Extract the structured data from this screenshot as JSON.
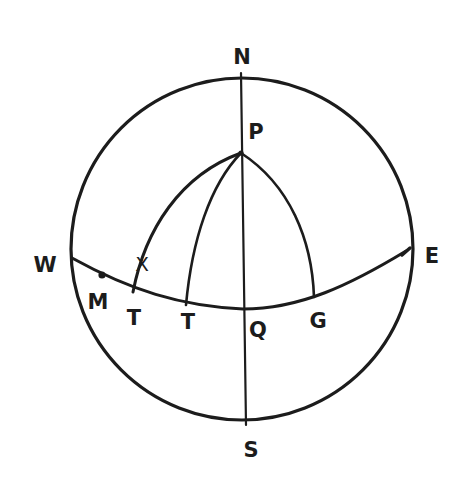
{
  "diagram": {
    "type": "celestial-sphere",
    "stroke_color": "#1c1c1c",
    "background": "#ffffff",
    "labels": {
      "north": "N",
      "south": "S",
      "east": "E",
      "west": "W",
      "pole": "P",
      "star": "X",
      "point_m": "M",
      "point_t1": "T",
      "point_t2": "T",
      "point_q": "Q",
      "point_g": "G"
    }
  }
}
